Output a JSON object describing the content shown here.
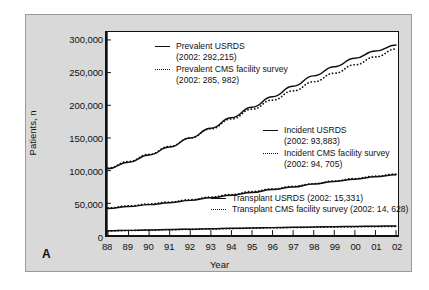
{
  "panel": {
    "label": "A"
  },
  "chart_data": {
    "type": "line",
    "title": "",
    "xlabel": "Year",
    "ylabel": "Patients, n",
    "xlim": [
      1988,
      2002
    ],
    "ylim": [
      0,
      300000
    ],
    "ytick_values": [
      0,
      50000,
      100000,
      150000,
      200000,
      250000,
      300000
    ],
    "ytick_labels": [
      "0",
      "50,000",
      "100,000",
      "150,000",
      "200,000",
      "250,000",
      "300,000"
    ],
    "x": [
      1988,
      1989,
      1990,
      1991,
      1992,
      1993,
      1994,
      1995,
      1996,
      1997,
      1998,
      1999,
      2000,
      2001,
      2002
    ],
    "xtick_labels": [
      "88",
      "89",
      "90",
      "91",
      "92",
      "93",
      "94",
      "95",
      "96",
      "97",
      "98",
      "99",
      "00",
      "01",
      "02"
    ],
    "grid": false,
    "legend_position": "inside-plot",
    "series": [
      {
        "name": "Prevalent USRDS",
        "style": "solid",
        "color": "#111111",
        "values": [
          103000,
          113000,
          124000,
          136000,
          150000,
          165000,
          181000,
          197000,
          213000,
          229000,
          245000,
          259000,
          272000,
          283000,
          292215
        ]
      },
      {
        "name": "Prevalent CMS facility survey",
        "style": "dotted",
        "color": "#111111",
        "values": [
          104000,
          114000,
          125000,
          137000,
          150000,
          164000,
          179000,
          194000,
          208000,
          222000,
          236000,
          249000,
          262000,
          274000,
          285982
        ]
      },
      {
        "name": "Incident USRDS",
        "style": "solid",
        "color": "#111111",
        "values": [
          42000,
          45000,
          48000,
          51000,
          54500,
          58500,
          62500,
          66500,
          71000,
          75000,
          79500,
          83500,
          87000,
          90500,
          93883
        ]
      },
      {
        "name": "Incident CMS facility survey",
        "style": "dotted",
        "color": "#111111",
        "values": [
          43000,
          46000,
          49000,
          52000,
          55500,
          59500,
          63500,
          68000,
          72000,
          76000,
          80000,
          84000,
          88000,
          91500,
          94705
        ]
      },
      {
        "name": "Transplant USRDS",
        "style": "solid",
        "color": "#111111",
        "values": [
          8000,
          8600,
          9200,
          9900,
          10500,
          11100,
          11700,
          12300,
          12800,
          13300,
          13800,
          14200,
          14600,
          15000,
          15331
        ]
      },
      {
        "name": "Transplant CMS facility survey",
        "style": "dotted",
        "color": "#111111",
        "values": [
          7800,
          8400,
          9000,
          9600,
          10200,
          10800,
          11400,
          12000,
          12500,
          13000,
          13400,
          13800,
          14100,
          14400,
          14628
        ]
      }
    ],
    "legend": [
      {
        "label": "Prevalent USRDS",
        "sub": "(2002: 292,215)",
        "style": "solid"
      },
      {
        "label": "Prevalent CMS facility survey",
        "sub": "(2002: 285, 982)",
        "style": "dotted"
      },
      {
        "label": "Incident USRDS",
        "sub": "(2002: 93,883)",
        "style": "solid"
      },
      {
        "label": "Incident CMS facility survey",
        "sub": "(2002: 94, 705)",
        "style": "dotted"
      },
      {
        "label": "Transplant USRDS (2002: 15,331)",
        "sub": "",
        "style": "solid"
      },
      {
        "label": "Transplant CMS facility survey (2002: 14, 628)",
        "sub": "",
        "style": "dotted"
      }
    ]
  }
}
